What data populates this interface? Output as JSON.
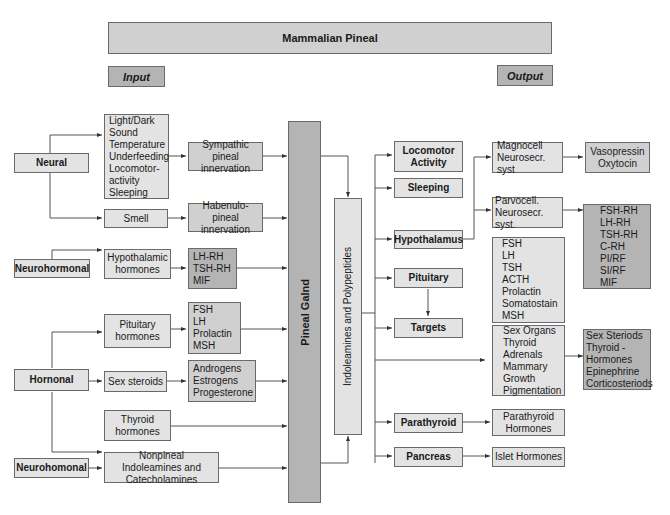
{
  "header": {
    "title": "Mammalian Pineal",
    "input_label": "Input",
    "output_label": "Output"
  },
  "inputs": {
    "neural": {
      "label": "Neural",
      "stimuli": [
        "Light/Dark",
        "Sound",
        "Temperature",
        "Underfeeding",
        "Locomotor-",
        "activity",
        "Sleeping"
      ],
      "sympathetic": "Sympathic pineal innervation",
      "smell": "Smell",
      "habenulo": "Habenulo-pineal innervation"
    },
    "neurohormonal": {
      "label": "Neurohormonal",
      "hypothalamic": "Hypothalamic hormones",
      "releasing": [
        "LH-RH",
        "TSH-RH",
        "MIF"
      ]
    },
    "hormonal": {
      "label": "Hornonal",
      "pituitary": "Pituitary hormones",
      "pituitary_list": [
        "FSH",
        "LH",
        "Prolactin",
        "MSH"
      ],
      "sex_steroids": "Sex steroids",
      "sex_list": [
        "Androgens",
        "Estrogens",
        "Progesterone"
      ],
      "thyroid": "Thyroid hormones"
    },
    "neurohomonal": {
      "label": "Neurohomonal",
      "nonpineal": "Nonpineal Indoleamines and Catecholamines"
    }
  },
  "center": {
    "gland": "Pineal Galnd",
    "products": "Indoleamines and Polypeptides"
  },
  "outputs": {
    "locomotor": "Locomotor Activity",
    "sleeping": "Sleeping",
    "hypothalamus": "Hypothalamus",
    "magnocell": [
      "Magnocell",
      "Neurosecr. syst"
    ],
    "vaso": [
      "Vasopressin",
      "Oxytocin"
    ],
    "parvocell": [
      "Parvocell.",
      "Neurosecr. syst."
    ],
    "parvo_list": [
      "FSH-RH",
      "LH-RH",
      "TSH-RH",
      "C-RH",
      "PI/RF",
      "SI/RF",
      "MIF"
    ],
    "pituitary": "Pituitary",
    "pit_list": [
      "FSH",
      "LH",
      "TSH",
      "ACTH",
      "Prolactin",
      "Somatostain",
      "MSH"
    ],
    "targets": "Targets",
    "target_list": [
      "Sex Organs",
      "Thyroid",
      "Adrenals",
      "Mammary",
      "Growth",
      "Pigmentation"
    ],
    "target_hormones": [
      "Sex Steriods",
      "Thyroid -",
      "Hormones",
      "Epinephrine",
      "Corticosteriods"
    ],
    "parathyroid": "Parathyroid",
    "parathyroid_hormones": "Parathyroid Hormones",
    "pancreas": "Pancreas",
    "islet": "Islet Hormones"
  },
  "colors": {
    "light_box": "#e3e3e3",
    "mid_box": "#d0d0d0",
    "dark_box": "#b4b4b4",
    "line": "#555555"
  }
}
